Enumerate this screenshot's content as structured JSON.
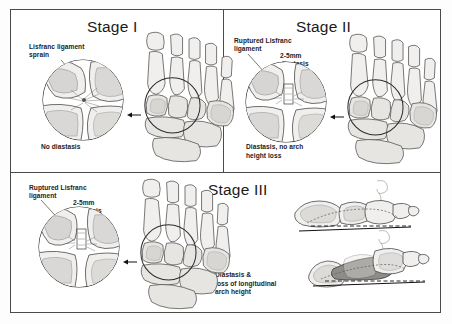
{
  "figure": {
    "panels": [
      {
        "id": "stage-1",
        "title": "Stage I",
        "labels": [
          {
            "id": "ligament",
            "text": "Lisfranc ligament\nsprain"
          }
        ],
        "caption": "No diastasis"
      },
      {
        "id": "stage-2",
        "title": "Stage II",
        "labels": [
          {
            "id": "ligament",
            "text": "Ruptured Lisfranc\nligament"
          },
          {
            "id": "diastasis",
            "text": "2-5mm\ndiastasis"
          }
        ],
        "caption": "Diastasis, no arch\nheight loss"
      },
      {
        "id": "stage-3",
        "title": "Stage III",
        "labels": [
          {
            "id": "ligament",
            "text": "Ruptured Lisfranc\nligament"
          },
          {
            "id": "diastasis",
            "text": "2-5mm\ndiastasis"
          }
        ],
        "caption": "Diastasis &\nloss of longitudinal\narch height"
      }
    ]
  },
  "colors": {
    "frame": "#4a4a4a",
    "bone_fill": "#f0efed",
    "bone_shadow": "#b9b7b3",
    "collapsed_arch": "#8e8c88",
    "text": "#222222",
    "background": "#ffffff"
  },
  "icons": {
    "pointer_arrow": "arrow-left-icon",
    "magnifier_circle": "magnified-region-circle-icon",
    "reference_line": "dashed-reference-line-icon"
  }
}
